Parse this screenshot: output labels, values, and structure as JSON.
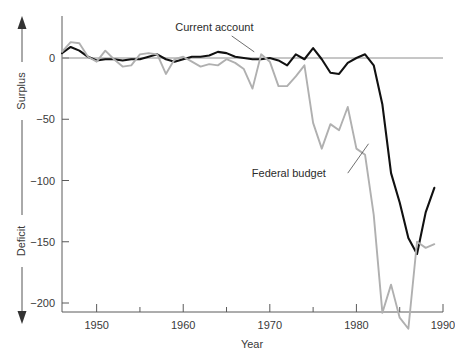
{
  "chart_data": {
    "type": "line",
    "title": "",
    "xlabel": "Year",
    "ylabel": "",
    "xlim": [
      1946,
      1990
    ],
    "ylim": [
      -210,
      30
    ],
    "grid": false,
    "legend_position": "inline-annotations",
    "x_ticks_major": [
      1950,
      1960,
      1970,
      1980,
      1990
    ],
    "x_ticks_minor": [
      1955,
      1965,
      1975,
      1985
    ],
    "x_tick_labels": [
      "1950",
      "1960",
      "1970",
      "1980",
      "1990"
    ],
    "y_ticks": [
      0,
      -50,
      -100,
      -150,
      -200
    ],
    "y_tick_labels": [
      "0",
      "−50",
      "−100",
      "−150",
      "−200"
    ],
    "direction_labels": {
      "positive": "Surplus",
      "negative": "Deficit"
    },
    "series": [
      {
        "name": "Current account",
        "color": "#111111",
        "label_x": 1963.6,
        "label_y": 22,
        "leader_from": [
          1965.6,
          18
        ],
        "leader_to": [
          1968.2,
          5
        ],
        "x": [
          1946,
          1947,
          1948,
          1949,
          1950,
          1951,
          1952,
          1953,
          1954,
          1955,
          1956,
          1957,
          1958,
          1959,
          1960,
          1961,
          1962,
          1963,
          1964,
          1965,
          1966,
          1967,
          1968,
          1969,
          1970,
          1971,
          1972,
          1973,
          1974,
          1975,
          1976,
          1977,
          1978,
          1979,
          1980,
          1981,
          1982,
          1983,
          1984,
          1985,
          1986,
          1987,
          1988,
          1989
        ],
        "values": [
          4,
          9,
          6,
          1,
          -2,
          -1,
          -1,
          -2,
          -1,
          -1,
          1,
          3,
          -1,
          -3,
          -1,
          1,
          1,
          2,
          5,
          4,
          1,
          0,
          -1,
          -1,
          0,
          -2,
          -6,
          3,
          -1,
          8,
          -1,
          -12,
          -13,
          -4,
          0,
          3,
          -6,
          -38,
          -94,
          -118,
          -147,
          -160,
          -126,
          -106
        ]
      },
      {
        "name": "Federal budget",
        "color": "#b0b0b0",
        "label_x": 1972.2,
        "label_y": -97,
        "leader_from": [
          1979.0,
          -94
        ],
        "leader_to": [
          1981.4,
          -70
        ],
        "x": [
          1946,
          1947,
          1948,
          1949,
          1950,
          1951,
          1952,
          1953,
          1954,
          1955,
          1956,
          1957,
          1958,
          1959,
          1960,
          1961,
          1962,
          1963,
          1964,
          1965,
          1966,
          1967,
          1968,
          1969,
          1970,
          1971,
          1972,
          1973,
          1974,
          1975,
          1976,
          1977,
          1978,
          1979,
          1980,
          1981,
          1982,
          1983,
          1984,
          1985,
          1986,
          1987,
          1988,
          1989
        ],
        "values": [
          5,
          13,
          12,
          1,
          -3,
          6,
          -1,
          -7,
          -6,
          3,
          4,
          3,
          -13,
          -1,
          1,
          -3,
          -7,
          -5,
          -6,
          -1,
          -4,
          -9,
          -25,
          3,
          -3,
          -23,
          -23,
          -15,
          -6,
          -53,
          -74,
          -54,
          -59,
          -40,
          -74,
          -79,
          -128,
          -208,
          -185,
          -212,
          -221,
          -150,
          -155,
          -152
        ]
      }
    ],
    "note_y_scale": "values plotted on a vertical axis from about 30 down to -210 (billions of dollars)"
  },
  "axis": {
    "x_title": "Year",
    "surplus_label": "Surplus",
    "deficit_label": "Deficit"
  },
  "annotations": {
    "current_account": "Current account",
    "federal_budget": "Federal budget"
  },
  "colors": {
    "current_account": "#111111",
    "federal_budget": "#b0b0b0",
    "axis": "#5a5a5a",
    "zero_line": "#8e8e8e",
    "background": "#ffffff"
  }
}
